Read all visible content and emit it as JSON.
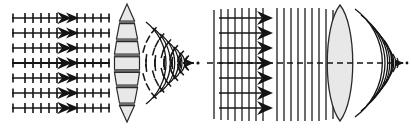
{
  "figure": {
    "background_color": "#ffffff",
    "stroke_color": "#1a1a1a",
    "lens_fill_color": "#e8e8e8",
    "lens_band_color": "#6a6a6a",
    "width": 411,
    "height": 129
  },
  "panels": [
    {
      "id": "left",
      "name": "segmented-lens-ray-panel",
      "label": "",
      "x": 0,
      "width": 206,
      "incoming": {
        "type": "ray-arrows",
        "count": 7,
        "y_positions": [
          18,
          33,
          48,
          63,
          78,
          93,
          108
        ],
        "x_start": 12,
        "x_end": 112,
        "tick_count": 9,
        "tick_half_height": 5,
        "arrow_x": 62,
        "arrow_count": 2,
        "description": "Seven horizontal ray arrows with transverse wavefront tick marks travelling left to right"
      },
      "lens": {
        "type": "segmented-stack",
        "center_x": 127,
        "center_y": 63,
        "half_height": 60,
        "max_half_width": 13,
        "segments": 7,
        "band_count": 6,
        "description": "Stacked trapezoidal segments forming a biconvex profile with dark separator bands"
      },
      "outgoing": {
        "type": "converging-arcs-with-ticks",
        "focus_x": 193,
        "focus_y": 63,
        "arc_count": 5,
        "ray_count": 9,
        "half_angle_deg": 42,
        "description": "Curved wavefront arcs crossed by tick marks converging to a focal point arrowhead"
      }
    },
    {
      "id": "right",
      "name": "wavefront-lens-panel",
      "label": "",
      "x": 205,
      "width": 206,
      "incoming": {
        "type": "plane-wavefronts",
        "line_count": 17,
        "x_start": 8,
        "x_spacing": 7.2,
        "y_top": 8,
        "y_bottom": 120,
        "arrow_count": 7,
        "arrow_y_positions": [
          18,
          33,
          48,
          63,
          78,
          93,
          108
        ],
        "arrow_x_start": 14,
        "arrow_x_end": 70,
        "description": "Vertical plane wavefront lines with horizontal propagation arrows"
      },
      "lens": {
        "type": "biconvex",
        "center_x": 135,
        "center_y": 63,
        "half_height": 58,
        "half_width": 18,
        "description": "Solid biconvex lens, light grey fill, thin dark outline"
      },
      "outgoing": {
        "type": "spherical-wavefront-arcs",
        "focus_x": 196,
        "focus_y": 63,
        "arc_count": 9,
        "half_angle_deg": 52,
        "description": "Concentric spherical wavefront arcs collapsing to the focal point"
      },
      "optical_axis": {
        "type": "dashed",
        "y": 63,
        "x_start": 2,
        "x_end": 200,
        "dash": "6 4",
        "description": "Dashed horizontal optical axis spanning the panel"
      }
    }
  ]
}
